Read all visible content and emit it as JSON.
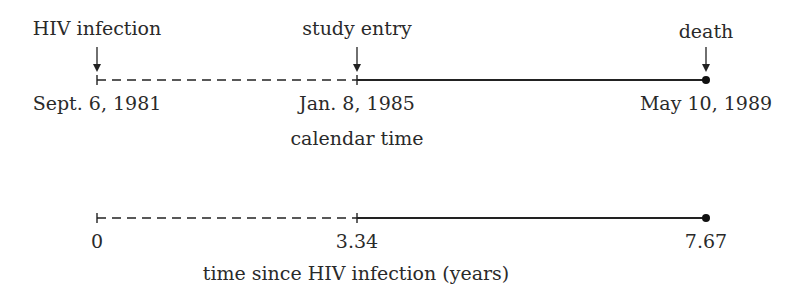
{
  "calendar_timeline": {
    "events": [
      {
        "label": "HIV infection",
        "date": "Sept. 6, 1981"
      },
      {
        "label": "study entry",
        "date": "Jan. 8, 1985"
      },
      {
        "label": "death",
        "date": "May 10, 1989"
      }
    ],
    "axis_label": "calendar time"
  },
  "elapsed_timeline": {
    "ticks": [
      "0",
      "3.34",
      "7.67"
    ],
    "axis_label": "time since HIV infection (years)"
  },
  "segments": {
    "before_entry": "dashed",
    "after_entry": "solid",
    "end_marker": "filled-dot"
  }
}
